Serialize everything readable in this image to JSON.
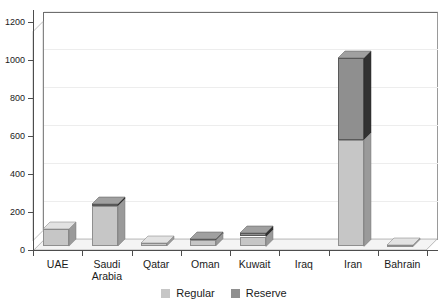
{
  "chart_data": {
    "type": "bar",
    "subtype": "stacked-3d-column",
    "title": "",
    "subtitle": "",
    "xlabel": "",
    "ylabel": "",
    "ylim": [
      0,
      1200
    ],
    "ytick_values": [
      0,
      200,
      400,
      600,
      800,
      1000,
      1200
    ],
    "ytick_labels": [
      "0",
      "200",
      "400",
      "600",
      "800",
      "1000",
      "1200"
    ],
    "grid": true,
    "legend_position": "bottom-center",
    "categories": [
      "UAE",
      "Saudi\nArabia",
      "Qatar",
      "Oman",
      "Kuwait",
      "Iraq",
      "Iran",
      "Bahrain"
    ],
    "category_labels": [
      "UAE",
      "Saudi Arabia",
      "Qatar",
      "Oman",
      "Kuwait",
      "Iraq",
      "Iran",
      "Bahrain"
    ],
    "series": [
      {
        "name": "Regular",
        "color": "#c6c6c6",
        "values": [
          90,
          210,
          15,
          30,
          50,
          0,
          560,
          5
        ]
      },
      {
        "name": "Reserve",
        "color": "#8f8f8f",
        "values": [
          0,
          10,
          0,
          8,
          20,
          0,
          430,
          0
        ]
      }
    ],
    "totals": [
      90,
      220,
      15,
      38,
      70,
      0,
      990,
      5
    ]
  },
  "legend": {
    "items": [
      {
        "label": "Regular",
        "color": "#c6c6c6"
      },
      {
        "label": "Reserve",
        "color": "#8f8f8f"
      }
    ]
  },
  "colors": {
    "regular": "#c6c6c6",
    "reserve": "#8f8f8f",
    "axis": "#4d4d4d",
    "grid": "#ededed",
    "background": "#ffffff",
    "text": "#1a1a1a"
  }
}
